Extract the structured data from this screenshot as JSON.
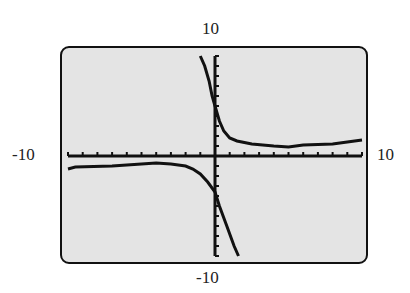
{
  "window": {
    "xmin": "-10",
    "xmax": "10",
    "ymin": "-10",
    "ymax": "10"
  },
  "chart_data": {
    "type": "line",
    "title": "",
    "xlabel": "",
    "ylabel": "",
    "xlim": [
      -10,
      10
    ],
    "ylim": [
      -10,
      10
    ],
    "xtick_step": 1,
    "ytick_step": 1,
    "grid": false,
    "legend": null,
    "series": [
      {
        "name": "left branch (y<0 on left, then steep line down right of asymptote)",
        "points": [
          [
            -10,
            -1.3
          ],
          [
            -9.5,
            -1.1
          ],
          [
            -7,
            -1.0
          ],
          [
            -5,
            -0.8
          ],
          [
            -4,
            -0.7
          ],
          [
            -3,
            -0.8
          ],
          [
            -2,
            -1.0
          ],
          [
            -1.5,
            -1.3
          ],
          [
            -1,
            -1.8
          ],
          [
            -0.5,
            -2.6
          ],
          [
            0,
            -3.6
          ],
          [
            0.3,
            -5
          ],
          [
            0.8,
            -7
          ],
          [
            1.3,
            -9
          ],
          [
            1.6,
            -10
          ]
        ]
      },
      {
        "name": "right branch (steep from top left of y-axis, then decays toward ~1)",
        "points": [
          [
            -1,
            10
          ],
          [
            -0.7,
            9
          ],
          [
            -0.4,
            7.5
          ],
          [
            -0.2,
            6
          ],
          [
            0,
            5
          ],
          [
            0.3,
            3.5
          ],
          [
            0.6,
            2.5
          ],
          [
            1,
            1.8
          ],
          [
            1.5,
            1.5
          ],
          [
            2.5,
            1.2
          ],
          [
            4,
            1.0
          ],
          [
            5,
            0.9
          ],
          [
            6,
            1.1
          ],
          [
            8,
            1.2
          ],
          [
            9,
            1.4
          ],
          [
            10,
            1.6
          ]
        ]
      }
    ]
  }
}
